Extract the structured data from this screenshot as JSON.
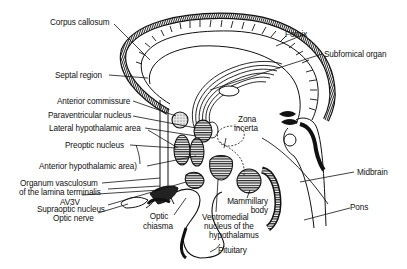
{
  "diagram": {
    "type": "anatomical-sagittal-section",
    "colors": {
      "ink": "#111111",
      "background": "#ffffff"
    },
    "labels": {
      "corpus_callosum": "Corpus callosum",
      "fornix": "Fornix",
      "subfornical_organ": "Subfornical organ",
      "septal_region": "Septal region",
      "anterior_commissure": "Anterior commissure",
      "paraventricular_nucleus": "Paraventricular nucleus",
      "lateral_hypothalamic_area": "Lateral hypothalamic area",
      "zona_incerta_1": "Zona",
      "zona_incerta_2": "incerta",
      "preoptic_nucleus": "Preoptic nucleus",
      "anterior_hypothalamic_area": "Anterior hypothalamic area)",
      "ovlt_1": "Organum vasculosum",
      "ovlt_2": "of the lamina terminalis",
      "av3v": "AV3V",
      "supraoptic_nucleus": "Supraoptic nucleus",
      "optic_nerve": "Optic nerve",
      "optic_chiasma_1": "Optic",
      "optic_chiasma_2": "chiasma",
      "midbrain": "Midbrain",
      "pons": "Pons",
      "mammillary_body_1": "Mammillary",
      "mammillary_body_2": "body",
      "ventromedial_1": "Ventromedial",
      "ventromedial_2": "nucleus of the",
      "ventromedial_3": "hypothalamus",
      "pituitary": "Pituitary"
    }
  }
}
